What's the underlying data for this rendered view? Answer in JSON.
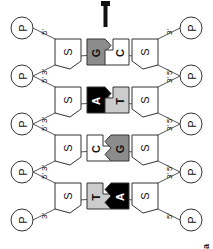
{
  "figure": {
    "label": "a",
    "top_marker": "T"
  },
  "legend_glyphs": {
    "phosphate": "P",
    "sugar": "S",
    "five_prime": "5'",
    "three_prime": "3'"
  },
  "colors": {
    "adenine": "#000000",
    "thymine": "#cccccc",
    "guanine": "#8c8c8c",
    "cytosine": "#ffffff",
    "outline": "#333333",
    "backbone": "#555555",
    "hbond": "#999999",
    "background": "#ffffff"
  },
  "strands": [
    {
      "name": "top-strand",
      "direction_left": "3'",
      "direction_right": "5'",
      "phosphates": [
        "P",
        "P",
        "P",
        "P",
        "P"
      ],
      "sugars": [
        "S",
        "S",
        "S",
        "S"
      ],
      "bases": [
        {
          "letter": "T",
          "type": "pyrimidine",
          "fill": "#cccccc",
          "text": "#111111"
        },
        {
          "letter": "C",
          "type": "pyrimidine",
          "fill": "#ffffff",
          "text": "#111111"
        },
        {
          "letter": "A",
          "type": "purine",
          "fill": "#000000",
          "text": "#ffffff"
        },
        {
          "letter": "G",
          "type": "purine",
          "fill": "#8c8c8c",
          "text": "#111111"
        }
      ],
      "prime_labels": [
        "3'",
        "5'",
        "3'",
        "5'",
        "3'",
        "5'",
        "3'",
        "5'"
      ]
    },
    {
      "name": "bottom-strand",
      "direction_left": "5'",
      "direction_right": "3'",
      "phosphates": [
        "P",
        "P",
        "P",
        "P",
        "P"
      ],
      "sugars": [
        "S",
        "S",
        "S",
        "S"
      ],
      "bases": [
        {
          "letter": "A",
          "type": "purine",
          "fill": "#000000",
          "text": "#ffffff"
        },
        {
          "letter": "G",
          "type": "purine",
          "fill": "#8c8c8c",
          "text": "#111111"
        },
        {
          "letter": "T",
          "type": "pyrimidine",
          "fill": "#cccccc",
          "text": "#111111"
        },
        {
          "letter": "C",
          "type": "pyrimidine",
          "fill": "#ffffff",
          "text": "#111111"
        }
      ],
      "prime_labels": [
        "5'",
        "3'",
        "5'",
        "3'",
        "5'",
        "3'",
        "5'",
        "3'"
      ]
    }
  ],
  "base_pairs": [
    {
      "top": "T",
      "bottom": "A",
      "hydrogen_bonds": 2
    },
    {
      "top": "C",
      "bottom": "G",
      "hydrogen_bonds": 3
    },
    {
      "top": "A",
      "bottom": "T",
      "hydrogen_bonds": 2
    },
    {
      "top": "G",
      "bottom": "C",
      "hydrogen_bonds": 3
    }
  ]
}
